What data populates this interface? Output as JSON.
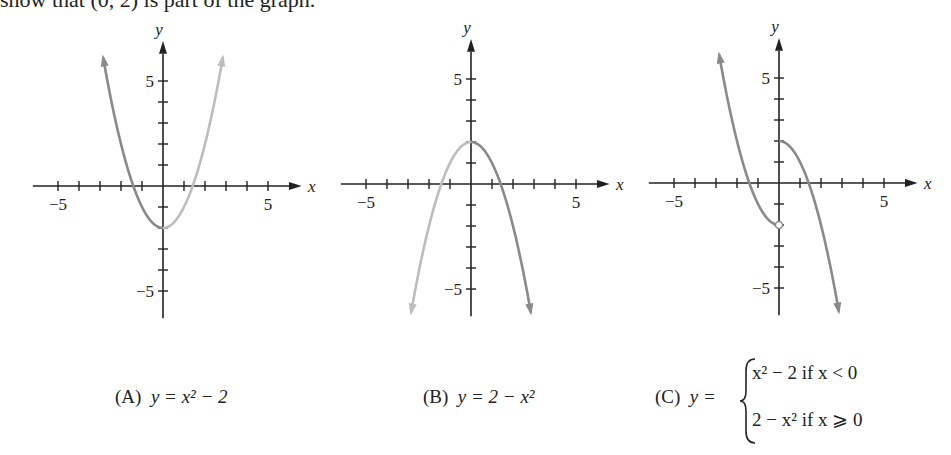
{
  "header": {
    "text": "show that (0, 2) is part of the graph."
  },
  "captions": {
    "a": {
      "label": "(A)",
      "formula": "y = x² − 2"
    },
    "b": {
      "label": "(B)",
      "formula": "y = 2 − x²"
    },
    "c": {
      "label": "(C)",
      "lhs": "y =",
      "piece1": "x² − 2   if  x < 0",
      "piece2": "2 − x²   if  x ⩾ 0"
    }
  },
  "axis_labels": {
    "x": "x",
    "y": "y",
    "xmin_tick": "−5",
    "xmax_tick": "5",
    "ymax_tick": "5",
    "ymin_tick": "−5"
  },
  "colors": {
    "curve_dark": "#8a8a8a",
    "curve_light": "#bdbdbd",
    "axis": "#222222"
  },
  "chart_data": [
    {
      "type": "line",
      "title": "(A) y = x^2 - 2",
      "xlabel": "x",
      "ylabel": "y",
      "xlim": [
        -6,
        6
      ],
      "ylim": [
        -6,
        7
      ],
      "xticks": [
        -5,
        -4,
        -3,
        -2,
        -1,
        1,
        2,
        3,
        4,
        5
      ],
      "yticks": [
        -5,
        -4,
        -3,
        -2,
        -1,
        1,
        2,
        3,
        4,
        5
      ],
      "tick_labels": {
        "x": {
          "-5": "−5",
          "5": "5"
        },
        "y": {
          "5": "5",
          "-5": "−5"
        }
      },
      "series": [
        {
          "name": "x^2 - 2 (x<0, dark)",
          "x": [
            -3,
            -2.5,
            -2,
            -1.5,
            -1,
            -0.5,
            0
          ],
          "y": [
            7,
            4.25,
            2,
            0.25,
            -1,
            -1.75,
            -2
          ]
        },
        {
          "name": "x^2 - 2 (x>=0, light)",
          "x": [
            0,
            0.5,
            1,
            1.5,
            2,
            2.5,
            3
          ],
          "y": [
            -2,
            -1.75,
            -1,
            0.25,
            2,
            4.25,
            7
          ]
        }
      ],
      "grid": false
    },
    {
      "type": "line",
      "title": "(B) y = 2 - x^2",
      "xlabel": "x",
      "ylabel": "y",
      "xlim": [
        -6,
        6
      ],
      "ylim": [
        -6,
        7
      ],
      "xticks": [
        -5,
        -4,
        -3,
        -2,
        -1,
        1,
        2,
        3,
        4,
        5
      ],
      "yticks": [
        -5,
        -4,
        -3,
        -2,
        -1,
        1,
        2,
        3,
        4,
        5
      ],
      "series": [
        {
          "name": "2 - x^2 (x<0, light)",
          "x": [
            -3,
            -2.5,
            -2,
            -1.5,
            -1,
            -0.5,
            0
          ],
          "y": [
            -7,
            -4.25,
            -2,
            -0.25,
            1,
            1.75,
            2
          ]
        },
        {
          "name": "2 - x^2 (x>=0, dark)",
          "x": [
            0,
            0.5,
            1,
            1.5,
            2,
            2.5,
            3
          ],
          "y": [
            2,
            1.75,
            1,
            -0.25,
            -2,
            -4.25,
            -7
          ]
        }
      ],
      "grid": false
    },
    {
      "type": "line",
      "title": "(C) piecewise",
      "xlabel": "x",
      "ylabel": "y",
      "xlim": [
        -6,
        6
      ],
      "ylim": [
        -6,
        7
      ],
      "xticks": [
        -5,
        -4,
        -3,
        -2,
        -1,
        1,
        2,
        3,
        4,
        5
      ],
      "yticks": [
        -5,
        -4,
        -3,
        -2,
        -1,
        1,
        2,
        3,
        4,
        5
      ],
      "series": [
        {
          "name": "x^2 - 2 if x<0",
          "x": [
            -3,
            -2.5,
            -2,
            -1.5,
            -1,
            -0.5,
            0
          ],
          "y": [
            7,
            4.25,
            2,
            0.25,
            -1,
            -1.75,
            -2
          ],
          "endpoint": "open circle at (0,-2)"
        },
        {
          "name": "2 - x^2 if x>=0",
          "x": [
            0,
            0.5,
            1,
            1.5,
            2,
            2.5,
            3
          ],
          "y": [
            2,
            1.75,
            1,
            -0.25,
            -2,
            -4.25,
            -7
          ],
          "endpoint": "closed at (0,2)"
        }
      ],
      "grid": false
    }
  ]
}
